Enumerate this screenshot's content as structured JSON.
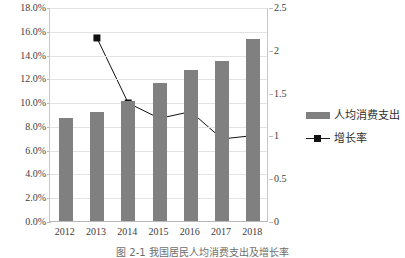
{
  "chart_data": {
    "type": "bar",
    "title": "",
    "xlabel": "",
    "ylabel": "",
    "categories": [
      "2012",
      "2013",
      "2014",
      "2015",
      "2016",
      "2017",
      "2018"
    ],
    "grid": true,
    "legend_position": "right",
    "left_axis": {
      "ylabel": "",
      "ylim": [
        0,
        18
      ],
      "tick_labels": [
        "18.0%",
        "16.0%",
        "14.0%",
        "12.0%",
        "10.0%",
        "8.0%",
        "6.0%",
        "4.0%",
        "2.0%",
        "0.0%"
      ],
      "tick_values": [
        18,
        16,
        14,
        12,
        10,
        8,
        6,
        4,
        2,
        0
      ]
    },
    "right_axis": {
      "ylabel": "",
      "ylim": [
        0,
        2.5
      ],
      "tick_labels": [
        "2.5",
        "2",
        "1.5",
        "1",
        "0.5",
        "0"
      ],
      "tick_values": [
        2.5,
        2,
        1.5,
        1,
        0.5,
        0
      ]
    },
    "series": [
      {
        "name": "人均消费支出",
        "type": "bar",
        "axis": "left",
        "color": "#808080",
        "values": [
          8.7,
          9.2,
          10.1,
          11.6,
          12.7,
          13.5,
          15.3
        ]
      },
      {
        "name": "增长率",
        "type": "line",
        "axis": "right",
        "color": "#111111",
        "marker": "square",
        "values": [
          null,
          2.15,
          1.39,
          1.21,
          1.29,
          0.97,
          1.01
        ]
      }
    ]
  },
  "legend": {
    "items": [
      {
        "label": "人均消费支出",
        "marker": "bar-swatch"
      },
      {
        "label": "增长率",
        "marker": "line-square-swatch"
      }
    ]
  },
  "caption": {
    "text": "图 2-1  我国居民人均消费支出及增长率"
  }
}
